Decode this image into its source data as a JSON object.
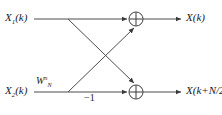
{
  "diagram": {
    "type": "fft-butterfly",
    "stroke_color": "#4d4d4d",
    "text_color": "#1a1a1a",
    "background_color": "#ffffff",
    "inputs": [
      {
        "id": "input-top",
        "base": "X",
        "subscript": "1",
        "argument": "(k)",
        "y": 19
      },
      {
        "id": "input-bottom",
        "base": "X",
        "subscript": "2",
        "argument": "(k)",
        "y": 92
      }
    ],
    "outputs": [
      {
        "id": "output-top",
        "base": "X",
        "argument": "(k)",
        "y": 19
      },
      {
        "id": "output-bottom",
        "base": "X",
        "argument": "(k+N/2)",
        "y": 92
      }
    ],
    "twiddle": {
      "base": "W",
      "subscript": "N",
      "superscript": "n"
    },
    "minus_one": "−1",
    "adders": [
      {
        "id": "adder-top",
        "cx": 136,
        "cy": 19,
        "r": 7,
        "symbol": "plus"
      },
      {
        "id": "adder-bottom",
        "cx": 136,
        "cy": 92,
        "r": 7,
        "symbol": "plus"
      }
    ],
    "nodes": [
      {
        "id": "branch-top",
        "x": 68,
        "y": 19
      },
      {
        "id": "branch-bottom",
        "x": 68,
        "y": 92
      }
    ],
    "edges": [
      {
        "id": "edge-in-top",
        "from": "input-top",
        "to": "branch-top"
      },
      {
        "id": "edge-in-bottom",
        "from": "input-bottom",
        "to": "branch-bottom"
      },
      {
        "id": "edge-top-straight",
        "from": "branch-top",
        "to": "adder-top"
      },
      {
        "id": "edge-bottom-straight",
        "from": "branch-bottom",
        "to": "adder-bottom"
      },
      {
        "id": "edge-cross-down",
        "from": "branch-top",
        "to": "adder-bottom"
      },
      {
        "id": "edge-cross-up",
        "from": "branch-bottom",
        "to": "adder-top"
      },
      {
        "id": "edge-out-top",
        "from": "adder-top",
        "to": "output-top"
      },
      {
        "id": "edge-out-bottom",
        "from": "adder-bottom",
        "to": "output-bottom"
      }
    ]
  }
}
